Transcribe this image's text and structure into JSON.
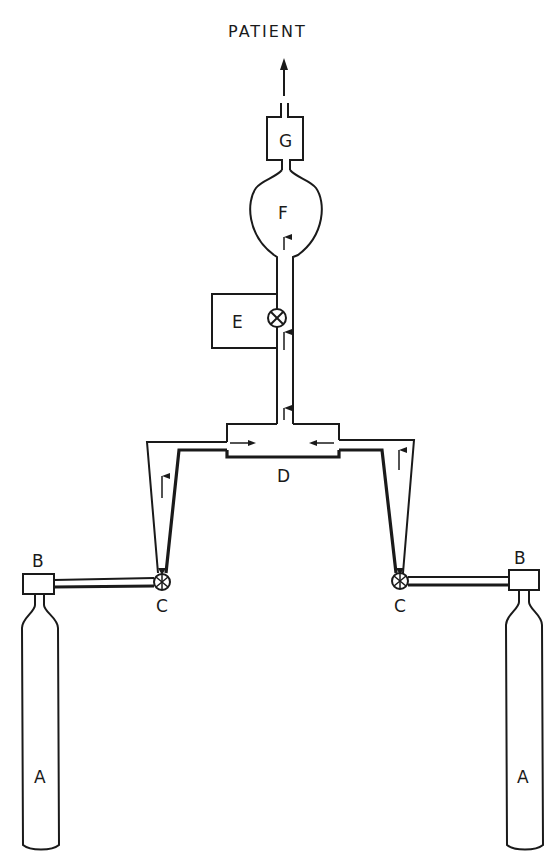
{
  "diagram": {
    "title": "PATIENT",
    "components": [
      {
        "id": "A",
        "label": "A",
        "description": "gas cylinder",
        "count": 2
      },
      {
        "id": "B",
        "label": "B",
        "description": "pressure regulator on cylinder",
        "count": 2
      },
      {
        "id": "C",
        "label": "C",
        "description": "flow control valve",
        "count": 2
      },
      {
        "id": "D",
        "label": "D",
        "description": "mixing chamber / junction",
        "count": 1
      },
      {
        "id": "E",
        "label": "E",
        "description": "side unit with valve",
        "count": 1
      },
      {
        "id": "F",
        "label": "F",
        "description": "reservoir bag / bulb",
        "count": 1
      },
      {
        "id": "G",
        "label": "G",
        "description": "chamber before patient outlet",
        "count": 1
      }
    ],
    "labels": {
      "a_left": "A",
      "a_right": "A",
      "b_left": "B",
      "b_right": "B",
      "c_left": "C",
      "c_right": "C",
      "d": "D",
      "e": "E",
      "f": "F",
      "g": "G"
    },
    "flow_direction": "from cylinders A through valves C, tapered flowmeter tubes, into D, up through E valve, F, G to PATIENT"
  }
}
